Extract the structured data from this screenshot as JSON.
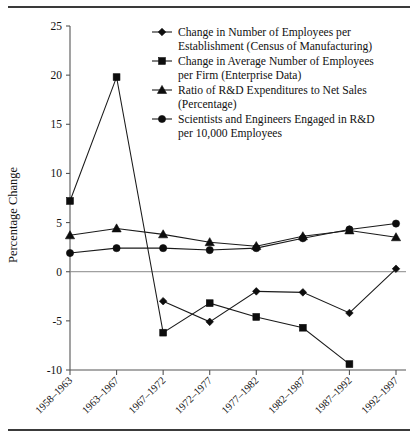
{
  "chart_data": {
    "type": "line",
    "title": "",
    "xlabel": "",
    "ylabel": "Percentage Change",
    "ylim": [
      -10,
      25
    ],
    "yticks": [
      -10,
      -5,
      0,
      5,
      10,
      15,
      20,
      25
    ],
    "yticklabels": [
      "-10",
      "-5",
      "0",
      "5",
      "10",
      "15",
      "20",
      "25"
    ],
    "grid": false,
    "zero_line": true,
    "legend_position": "upper-right-inside",
    "categories": [
      "1958–1963",
      "1963–1967",
      "1967–1972",
      "1972–1977",
      "1977–1982",
      "1982–1987",
      "1987–1992",
      "1992–1997"
    ],
    "series": [
      {
        "name": "Change in Number of Employees per Establishment (Census of Manufacturing)",
        "legend_line1": "Change in Number of Employees per",
        "legend_line2": "Establishment (Census of Manufacturing)",
        "marker": "diamond",
        "values": [
          null,
          null,
          -3.0,
          -5.1,
          -2.0,
          -2.1,
          -4.2,
          0.3
        ]
      },
      {
        "name": "Change in  Average Number of  Employees per Firm (Enterprise Data)",
        "legend_line1": "Change in  Average Number of  Employees",
        "legend_line2": "per Firm (Enterprise Data)",
        "marker": "square",
        "values": [
          7.2,
          19.8,
          -6.2,
          -3.2,
          -4.6,
          -5.7,
          -9.4,
          null
        ]
      },
      {
        "name": "Ratio of R&D Expenditures to Net Sales (Percentage)",
        "legend_line1": "Ratio of R&D Expenditures to Net Sales",
        "legend_line2": "(Percentage)",
        "marker": "triangle",
        "values": [
          3.7,
          4.4,
          3.8,
          3.0,
          2.6,
          3.6,
          4.2,
          3.5
        ]
      },
      {
        "name": "Scientists and Engineers Engaged in R&D per 10,000 Employees",
        "legend_line1": "Scientists and Engineers Engaged in R&D",
        "legend_line2": "per 10,000 Employees",
        "marker": "circle",
        "values": [
          1.9,
          2.4,
          2.4,
          2.2,
          2.4,
          3.4,
          4.3,
          4.9
        ]
      }
    ]
  },
  "axis": {
    "ylabel": "Percentage Change"
  }
}
